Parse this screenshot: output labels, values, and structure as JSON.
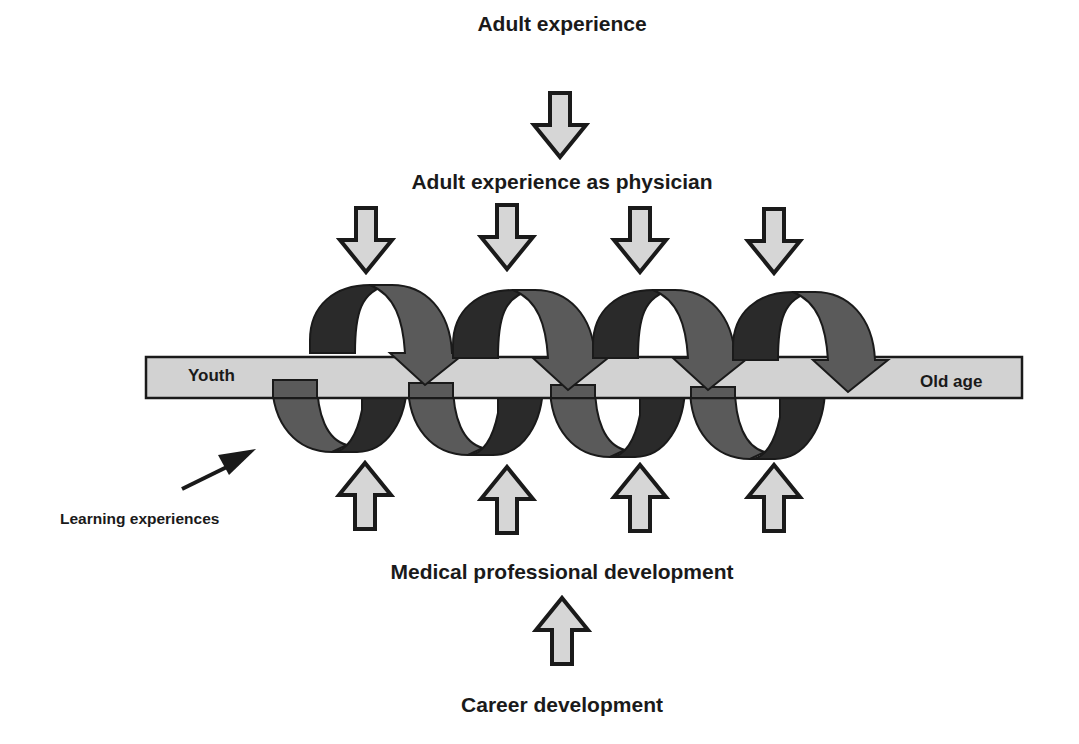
{
  "diagram": {
    "title_top": "Adult experience",
    "title_physician": "Adult experience as physician",
    "title_medical": "Medical professional development",
    "title_career": "Career development",
    "learning_label": "Learning experiences",
    "timeline": {
      "start_label": "Youth",
      "end_label": "Old age"
    },
    "spiral_loops": 4,
    "inflow_arrows_top": 4,
    "inflow_arrows_bottom": 4,
    "colors": {
      "bar_fill": "#d2d2d2",
      "arrow_fill": "#d6d6d6",
      "outline": "#1a1a1a",
      "spiral_dark": "#2a2a2a",
      "spiral_mid": "#5a5a5a"
    }
  }
}
